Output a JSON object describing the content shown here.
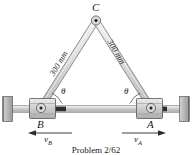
{
  "figure": {
    "name": "two-bar-linkage-with-sliders",
    "caption": "Problem 2/62",
    "points": {
      "apex": "C",
      "left_slider": "B",
      "right_slider": "A"
    },
    "dimensions": {
      "left_link": "300 mm",
      "right_link": "300 mm"
    },
    "angles": {
      "left": "θ",
      "right": "θ"
    },
    "velocities": {
      "left": {
        "symbol": "v",
        "subscript": "B",
        "direction": "left"
      },
      "right": {
        "symbol": "v",
        "subscript": "A",
        "direction": "right"
      }
    },
    "colors": {
      "link_fill": "#d7d7d7",
      "link_stroke": "#6b6b6b",
      "slider_fill": "#c9c9c9",
      "slider_stroke": "#5a5a5a",
      "rod_fill": "#cfcfcf",
      "rod_stroke": "#7a7a7a",
      "wall_fill": "#b9b9b9",
      "wall_stroke": "#5a5a5a",
      "ink": "#1a1a1a"
    }
  }
}
